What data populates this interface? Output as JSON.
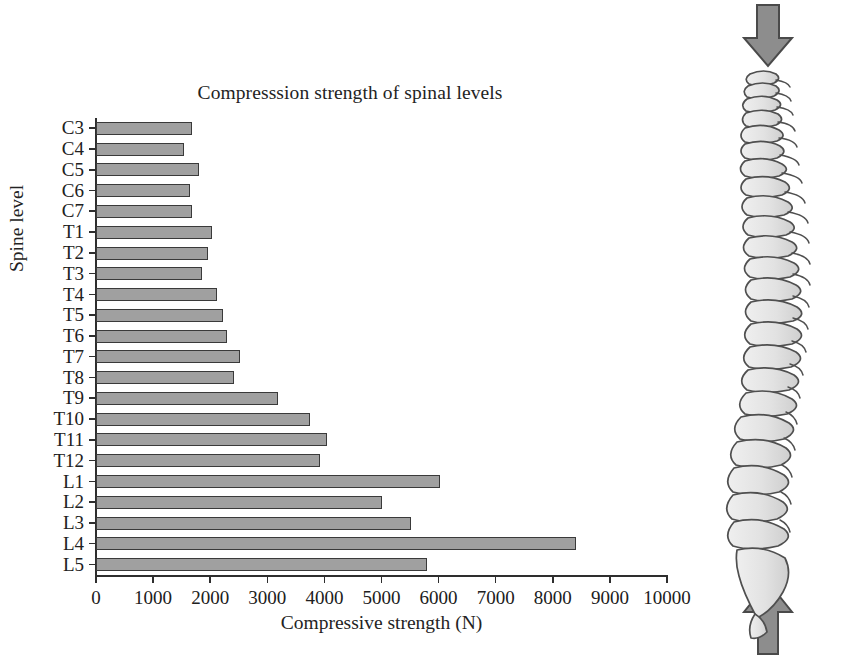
{
  "figure": {
    "background": "#ffffff",
    "bar_fill": "#a0a0a0",
    "bar_stroke": "#3a3a3a",
    "axis_color": "#2e2e2e",
    "arrow_fill": "#8d8d8d"
  },
  "chart_data": {
    "type": "bar",
    "orientation": "horizontal",
    "title": "Compresssion strength of spinal levels",
    "xlabel": "Compressive strength (N)",
    "ylabel": "Spine level",
    "xlim": [
      0,
      10000
    ],
    "xticks": [
      0,
      1000,
      2000,
      3000,
      4000,
      5000,
      6000,
      7000,
      8000,
      9000,
      10000
    ],
    "xtick_labels": [
      "0",
      "1000",
      "2000",
      "3000",
      "4000",
      "5000",
      "6000",
      "7000",
      "8000",
      "9000",
      "10000"
    ],
    "grid": false,
    "legend": null,
    "categories": [
      "C3",
      "C4",
      "C5",
      "C6",
      "C7",
      "T1",
      "T2",
      "T3",
      "T4",
      "T5",
      "T6",
      "T7",
      "T8",
      "T9",
      "T10",
      "T11",
      "T12",
      "L1",
      "L2",
      "L3",
      "L4",
      "L5"
    ],
    "values": [
      1680,
      1540,
      1800,
      1650,
      1680,
      2030,
      1970,
      1860,
      2120,
      2220,
      2300,
      2520,
      2420,
      3190,
      3750,
      4050,
      3920,
      6020,
      5010,
      5520,
      8410,
      5800
    ]
  },
  "spine_illustration": {
    "name": "lateral-spine-diagram",
    "top_arrow": "downward-compression-arrow",
    "bottom_arrow": "upward-reaction-arrow",
    "vertebra_count": 24
  }
}
